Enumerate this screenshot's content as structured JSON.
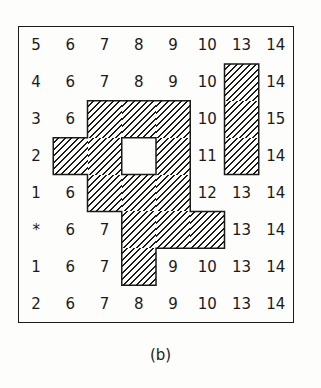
{
  "figure": {
    "caption": "(b)",
    "rows": 8,
    "cols": 8,
    "hatch_color": "#1a1a1a",
    "grid": [
      [
        "5",
        "6",
        "7",
        "8",
        "9",
        "10",
        "13",
        "14"
      ],
      [
        "4",
        "6",
        "7",
        "8",
        "9",
        "10",
        "H",
        "14"
      ],
      [
        "3",
        "6",
        "H",
        "H",
        "H",
        "10",
        "H",
        "15"
      ],
      [
        "2",
        "H",
        "H",
        "O",
        "H",
        "11",
        "H",
        "14"
      ],
      [
        "1",
        "6",
        "H",
        "H",
        "H",
        "12",
        "13",
        "14"
      ],
      [
        "*",
        "6",
        "7",
        "H",
        "H",
        "H",
        "13",
        "14"
      ],
      [
        "1",
        "6",
        "7",
        "H",
        "9",
        "10",
        "13",
        "14"
      ],
      [
        "2",
        "6",
        "7",
        "8",
        "9",
        "10",
        "13",
        "14"
      ]
    ],
    "legend": {
      "H": "hatched region (obstacle)",
      "O": "unhatched hole inside region",
      "*": "start marker"
    }
  }
}
